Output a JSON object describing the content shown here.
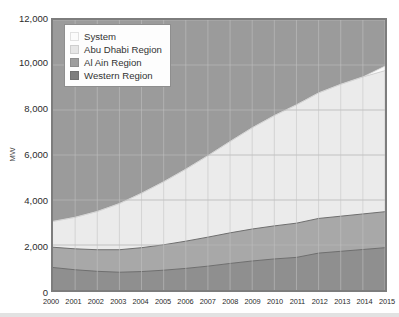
{
  "chart_data": {
    "type": "area",
    "stacked": true,
    "title": "",
    "subtitle": "",
    "xlabel": "",
    "ylabel": "MW",
    "x": [
      2000,
      2001,
      2002,
      2003,
      2004,
      2005,
      2006,
      2007,
      2008,
      2009,
      2010,
      2011,
      2012,
      2013,
      2014,
      2015
    ],
    "xtick_labels": [
      "2000",
      "2001",
      "2002",
      "2003",
      "2004",
      "2005",
      "2006",
      "2007",
      "2008",
      "2009",
      "2010",
      "2011",
      "2012",
      "2013",
      "2014",
      "2015"
    ],
    "ytick_labels": [
      "0",
      "2,000",
      "4,000",
      "6,000",
      "8,000",
      "10,000",
      "12,000"
    ],
    "ytick_values": [
      0,
      2000,
      4000,
      6000,
      8000,
      10000,
      12000
    ],
    "ylim": [
      0,
      12000
    ],
    "xlim": [
      2000,
      2015
    ],
    "grid": true,
    "legend_position": "top-left",
    "series": [
      {
        "name": "Western Region",
        "color": "#8f8f8f",
        "values": [
          1000,
          900,
          830,
          790,
          820,
          880,
          960,
          1060,
          1180,
          1290,
          1380,
          1450,
          1640,
          1720,
          1800,
          1880
        ]
      },
      {
        "name": "Al Ain Region",
        "color": "#a8a8a8",
        "values": [
          900,
          930,
          960,
          1000,
          1060,
          1130,
          1210,
          1290,
          1360,
          1420,
          1470,
          1520,
          1540,
          1560,
          1580,
          1600
        ]
      },
      {
        "name": "Abu Dhabi Region",
        "color": "#ebebeb",
        "values": [
          1150,
          1400,
          1700,
          2050,
          2420,
          2800,
          3200,
          3620,
          4060,
          4500,
          4900,
          5260,
          5580,
          5860,
          6090,
          6270
        ]
      },
      {
        "name": "System",
        "color": "#fbfbfb",
        "values": [
          0,
          0,
          0,
          0,
          0,
          0,
          0,
          0,
          0,
          0,
          0,
          0,
          0,
          0,
          0,
          200
        ]
      }
    ],
    "cumulative_top": [
      3050,
      3230,
      3490,
      3840,
      4300,
      4810,
      5370,
      5970,
      6600,
      7210,
      7750,
      8230,
      8760,
      9140,
      9470,
      9950
    ],
    "background_color": "#9b9b9b",
    "frame_color": "#7d7d7d",
    "gridline_color": "#b9b9b9"
  },
  "legend": {
    "items": [
      {
        "label": "System",
        "color": "#fbfbfb"
      },
      {
        "label": "Abu Dhabi Region",
        "color": "#e6e6e6"
      },
      {
        "label": "Al Ain Region",
        "color": "#9e9e9e"
      },
      {
        "label": "Western Region",
        "color": "#7e7e7e"
      }
    ]
  },
  "axis": {
    "y_title": "MW"
  }
}
